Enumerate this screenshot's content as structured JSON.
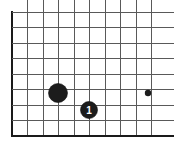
{
  "figure": {
    "type": "go-board-diagram",
    "background_color": "#ffffff",
    "width": 174,
    "height": 153
  },
  "board": {
    "origin_x": 12,
    "origin_y": 12,
    "spacing": 15.5,
    "columns": 10,
    "rows": 9,
    "line_color": "#595959",
    "edge_color": "#1a1a1a",
    "edge_width": 2.2,
    "line_width": 1,
    "edges": [
      {
        "name": "left-edge",
        "orientation": "vertical",
        "index": 0
      },
      {
        "name": "bottom-edge",
        "orientation": "horizontal",
        "index": 8
      }
    ]
  },
  "markers": [
    {
      "name": "star-point",
      "kind": "star-point",
      "column": 9,
      "row": 5,
      "cx": 148,
      "cy": 93,
      "radius": 3.2,
      "color": "#1c1c1c"
    }
  ],
  "stones": [
    {
      "name": "black-stone-unnumbered",
      "color": "black",
      "fill": "#1c1c1c",
      "column": 3,
      "row": 5,
      "cx": 58,
      "cy": 93,
      "radius": 9.5,
      "label": ""
    },
    {
      "name": "black-stone-move-1",
      "color": "black",
      "fill": "#1c1c1c",
      "column": 5,
      "row": 6,
      "cx": 89,
      "cy": 110,
      "radius": 8.5,
      "label": "1",
      "label_color": "#ffffff"
    }
  ]
}
